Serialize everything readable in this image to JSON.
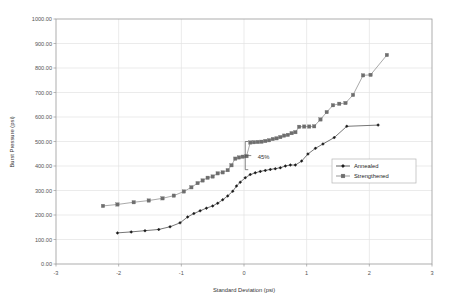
{
  "chart_data": {
    "type": "scatter",
    "title": "",
    "xlabel": "Standard Deviation (psi)",
    "ylabel": "Burst Pressure (psi)",
    "xlim": [
      -3,
      3
    ],
    "ylim": [
      0,
      1000
    ],
    "xticks": [
      "-3",
      "-2",
      "-1",
      "0",
      "1",
      "2",
      "3"
    ],
    "xtick_values": [
      -3,
      -2,
      -1,
      0,
      1,
      2,
      3
    ],
    "yticks": [
      "0.00",
      "100.00",
      "200.00",
      "300.00",
      "400.00",
      "500.00",
      "600.00",
      "700.00",
      "800.00",
      "900.00",
      "1000.00"
    ],
    "ytick_values": [
      0,
      100,
      200,
      300,
      400,
      500,
      600,
      700,
      800,
      900,
      1000
    ],
    "grid": true,
    "legend_position": "right-middle",
    "annotations": [
      {
        "text": "45%",
        "x": 0.02,
        "y_top": 500,
        "y_bottom": 385,
        "label_x": 0.22,
        "label_y": 437
      }
    ],
    "series": [
      {
        "name": "Annealed",
        "color": "#1a1a1a",
        "marker": "diamond",
        "points": [
          [
            -2.02,
            127
          ],
          [
            -1.8,
            131
          ],
          [
            -1.58,
            136
          ],
          [
            -1.36,
            141
          ],
          [
            -1.18,
            152
          ],
          [
            -1.02,
            168
          ],
          [
            -0.9,
            192
          ],
          [
            -0.8,
            206
          ],
          [
            -0.7,
            217
          ],
          [
            -0.6,
            228
          ],
          [
            -0.5,
            237
          ],
          [
            -0.42,
            248
          ],
          [
            -0.34,
            262
          ],
          [
            -0.26,
            278
          ],
          [
            -0.18,
            297
          ],
          [
            -0.12,
            318
          ],
          [
            -0.06,
            334
          ],
          [
            0.02,
            352
          ],
          [
            0.1,
            365
          ],
          [
            0.18,
            372
          ],
          [
            0.26,
            378
          ],
          [
            0.34,
            382
          ],
          [
            0.42,
            386
          ],
          [
            0.5,
            389
          ],
          [
            0.58,
            393
          ],
          [
            0.66,
            400
          ],
          [
            0.74,
            404
          ],
          [
            0.82,
            404
          ],
          [
            0.92,
            420
          ],
          [
            1.02,
            449
          ],
          [
            1.14,
            472
          ],
          [
            1.26,
            490
          ],
          [
            1.44,
            516
          ],
          [
            1.64,
            562
          ],
          [
            2.14,
            567
          ]
        ]
      },
      {
        "name": "Strengthened",
        "color": "#6e6e6e",
        "marker": "square",
        "points": [
          [
            -2.25,
            237
          ],
          [
            -2.02,
            243
          ],
          [
            -1.76,
            252
          ],
          [
            -1.52,
            259
          ],
          [
            -1.3,
            268
          ],
          [
            -1.12,
            279
          ],
          [
            -0.96,
            296
          ],
          [
            -0.84,
            313
          ],
          [
            -0.74,
            330
          ],
          [
            -0.66,
            341
          ],
          [
            -0.58,
            352
          ],
          [
            -0.5,
            357
          ],
          [
            -0.42,
            370
          ],
          [
            -0.34,
            374
          ],
          [
            -0.26,
            383
          ],
          [
            -0.2,
            403
          ],
          [
            -0.14,
            430
          ],
          [
            -0.08,
            435
          ],
          [
            -0.02,
            438
          ],
          [
            0.04,
            440
          ],
          [
            0.1,
            496
          ],
          [
            0.16,
            497
          ],
          [
            0.22,
            498
          ],
          [
            0.28,
            499
          ],
          [
            0.34,
            502
          ],
          [
            0.4,
            505
          ],
          [
            0.46,
            510
          ],
          [
            0.52,
            513
          ],
          [
            0.58,
            518
          ],
          [
            0.64,
            524
          ],
          [
            0.7,
            527
          ],
          [
            0.76,
            534
          ],
          [
            0.82,
            538
          ],
          [
            0.88,
            560
          ],
          [
            0.96,
            561
          ],
          [
            1.04,
            561
          ],
          [
            1.12,
            562
          ],
          [
            1.22,
            590
          ],
          [
            1.32,
            620
          ],
          [
            1.42,
            648
          ],
          [
            1.52,
            654
          ],
          [
            1.62,
            657
          ],
          [
            1.74,
            690
          ],
          [
            1.9,
            770
          ],
          [
            2.02,
            772
          ],
          [
            2.28,
            853
          ]
        ]
      }
    ]
  },
  "legend": {
    "items": [
      {
        "label": "Annealed",
        "marker": "diamond",
        "color": "#1a1a1a"
      },
      {
        "label": "Strengthened",
        "marker": "square",
        "color": "#6e6e6e"
      }
    ]
  },
  "colors": {
    "annealed": "#1a1a1a",
    "strengthened": "#6e6e6e",
    "grid": "#e2e2e2",
    "axis": "#9a9a9a",
    "text": "#555555"
  }
}
